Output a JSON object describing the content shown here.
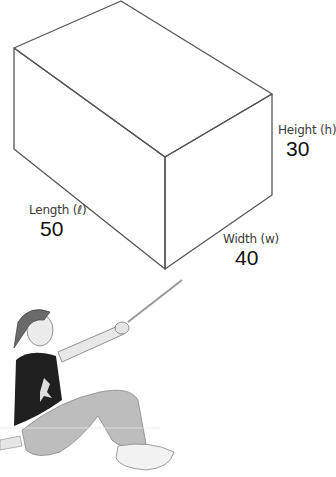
{
  "diagram": {
    "type": "rectangular-prism",
    "dimensions": [
      {
        "name": "height",
        "label": "Height (h)",
        "value": "30"
      },
      {
        "name": "width",
        "label": "Width (w)",
        "value": "40"
      },
      {
        "name": "length",
        "label": "Length (ℓ)",
        "value": "50"
      }
    ],
    "colors": {
      "line": "#555555",
      "background": "#ffffff"
    },
    "illustration": "boy-sitting-pointing-stick"
  }
}
